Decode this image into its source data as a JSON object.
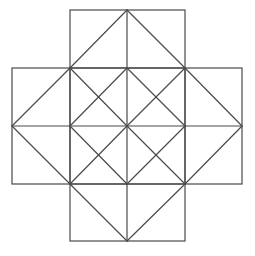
{
  "diagram": {
    "type": "geometric-figure",
    "stroke_color": "#4a4a4a",
    "background": "#ffffff",
    "grid": {
      "x": [
        12,
        70,
        127,
        185,
        242
      ],
      "y": [
        10,
        68,
        126,
        184,
        241
      ]
    },
    "squares": [
      {
        "name": "top",
        "x": 70,
        "y": 10,
        "w": 115,
        "h": 58
      },
      {
        "name": "left",
        "x": 12,
        "y": 68,
        "w": 58,
        "h": 116
      },
      {
        "name": "center",
        "x": 70,
        "y": 68,
        "w": 115,
        "h": 116
      },
      {
        "name": "right",
        "x": 185,
        "y": 68,
        "w": 57,
        "h": 116
      },
      {
        "name": "bottom",
        "x": 70,
        "y": 184,
        "w": 115,
        "h": 57
      }
    ],
    "lines": [
      [
        127,
        10,
        127,
        68
      ],
      [
        12,
        126,
        70,
        126
      ],
      [
        185,
        126,
        242,
        126
      ],
      [
        127,
        184,
        127,
        241
      ],
      [
        127,
        68,
        127,
        184
      ],
      [
        70,
        126,
        185,
        126
      ],
      [
        70,
        68,
        127,
        10
      ],
      [
        127,
        10,
        185,
        68
      ],
      [
        185,
        68,
        242,
        126
      ],
      [
        242,
        126,
        185,
        184
      ],
      [
        185,
        184,
        127,
        241
      ],
      [
        127,
        241,
        70,
        184
      ],
      [
        70,
        184,
        12,
        126
      ],
      [
        12,
        126,
        70,
        68
      ],
      [
        70,
        68,
        127,
        126
      ],
      [
        127,
        68,
        70,
        126
      ],
      [
        127,
        68,
        185,
        126
      ],
      [
        185,
        68,
        127,
        126
      ],
      [
        70,
        126,
        127,
        184
      ],
      [
        127,
        126,
        70,
        184
      ],
      [
        127,
        126,
        185,
        184
      ],
      [
        185,
        126,
        127,
        184
      ]
    ]
  }
}
